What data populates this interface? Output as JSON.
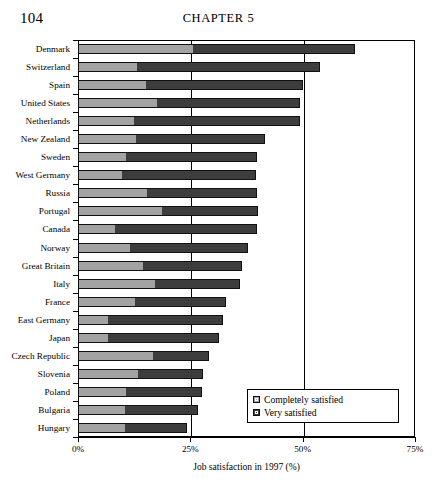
{
  "page": {
    "folio": "104",
    "running_head": "CHAPTER 5"
  },
  "legend": {
    "items": [
      {
        "label": "Completely satisfied",
        "color": "#a3a3a3",
        "icon": "legend-swatch-icon"
      },
      {
        "label": "Very satisfied",
        "color": "#3d3d3d",
        "icon": "legend-swatch-icon"
      }
    ]
  },
  "chart_data": {
    "type": "bar",
    "orientation": "horizontal",
    "stacked": true,
    "title": "",
    "xlabel": "Job satisfaction in 1997 (%)",
    "ylabel": "",
    "xlim": [
      0,
      75
    ],
    "xticks": [
      "0%",
      "25%",
      "50%",
      "75%"
    ],
    "xtick_values": [
      0,
      25,
      50,
      75
    ],
    "grid": "vertical-at-xticks",
    "legend_position": "bottom-right-inside",
    "categories": [
      "Denmark",
      "Switzerland",
      "Spain",
      "United States",
      "Netherlands",
      "New Zealand",
      "Sweden",
      "West Germany",
      "Russia",
      "Portugal",
      "Canada",
      "Norway",
      "Great Britain",
      "Italy",
      "France",
      "East Germany",
      "Japan",
      "Czech Republic",
      "Slovenia",
      "Poland",
      "Bulgaria",
      "Hungary"
    ],
    "series": [
      {
        "name": "Completely satisfied",
        "color": "#a3a3a3",
        "values": [
          25.5,
          13.1,
          15.1,
          17.6,
          12.5,
          12.9,
          10.7,
          9.8,
          15.4,
          18.7,
          8.2,
          11.6,
          14.5,
          17.1,
          12.7,
          6.7,
          6.7,
          16.7,
          13.4,
          10.7,
          10.5,
          10.5
        ]
      },
      {
        "name": "Very satisfied",
        "color": "#3d3d3d",
        "values": [
          36.2,
          40.8,
          35.0,
          31.8,
          36.9,
          28.7,
          29.1,
          29.9,
          24.5,
          21.4,
          31.6,
          26.3,
          22.0,
          19.0,
          20.3,
          25.6,
          24.7,
          12.5,
          14.4,
          16.9,
          16.2,
          13.8
        ]
      }
    ],
    "totals": [
      61.7,
      53.9,
      50.1,
      49.4,
      49.4,
      41.6,
      39.8,
      39.7,
      39.9,
      40.1,
      39.8,
      37.9,
      36.5,
      36.1,
      33.0,
      32.3,
      31.4,
      29.2,
      27.8,
      27.6,
      26.7,
      24.3
    ]
  }
}
